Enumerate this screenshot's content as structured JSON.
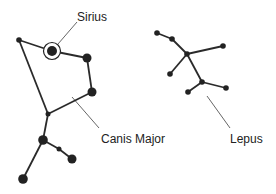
{
  "colors": {
    "background": "#ffffff",
    "star": "#222222",
    "edge": "#2a2a2a",
    "leader": "#555555",
    "text": "#222222"
  },
  "labels": {
    "sirius": {
      "text": "Sirius",
      "x": 77,
      "y": 10
    },
    "canis_major": {
      "text": "Canis Major",
      "x": 101,
      "y": 132
    },
    "lepus": {
      "text": "Lepus",
      "x": 230,
      "y": 132
    }
  },
  "constellations": [
    {
      "name": "Canis Major",
      "stars": [
        {
          "id": "cma1",
          "x": 19,
          "y": 40,
          "r": 2.8
        },
        {
          "id": "sirius",
          "x": 52,
          "y": 51,
          "r": 5,
          "ring": 8.5
        },
        {
          "id": "cma3",
          "x": 87,
          "y": 58,
          "r": 4.5
        },
        {
          "id": "cma4",
          "x": 92,
          "y": 92,
          "r": 4.5
        },
        {
          "id": "cma5",
          "x": 48,
          "y": 114,
          "r": 2.5
        },
        {
          "id": "cma6",
          "x": 43,
          "y": 140,
          "r": 4.8
        },
        {
          "id": "cma7",
          "x": 59,
          "y": 149,
          "r": 2.5
        },
        {
          "id": "cma8",
          "x": 72,
          "y": 159,
          "r": 4.5
        },
        {
          "id": "cma9",
          "x": 23,
          "y": 179,
          "r": 4.8
        }
      ],
      "edges": [
        [
          "cma1",
          "sirius"
        ],
        [
          "sirius",
          "cma3"
        ],
        [
          "cma3",
          "cma4"
        ],
        [
          "cma4",
          "cma5"
        ],
        [
          "cma1",
          "cma5"
        ],
        [
          "cma5",
          "cma6"
        ],
        [
          "cma6",
          "cma7"
        ],
        [
          "cma7",
          "cma8"
        ],
        [
          "cma6",
          "cma9"
        ]
      ]
    },
    {
      "name": "Lepus",
      "stars": [
        {
          "id": "lep1",
          "x": 157,
          "y": 33,
          "r": 2.8
        },
        {
          "id": "lep2",
          "x": 172,
          "y": 39,
          "r": 2.8
        },
        {
          "id": "lep3",
          "x": 187,
          "y": 54,
          "r": 2.8
        },
        {
          "id": "lep4",
          "x": 223,
          "y": 46,
          "r": 2.8
        },
        {
          "id": "lep5",
          "x": 170,
          "y": 74,
          "r": 2.8
        },
        {
          "id": "lep6",
          "x": 202,
          "y": 82,
          "r": 2.8
        },
        {
          "id": "lep7",
          "x": 188,
          "y": 92,
          "r": 2.8
        },
        {
          "id": "lep8",
          "x": 226,
          "y": 88,
          "r": 2.8
        }
      ],
      "edges": [
        [
          "lep1",
          "lep2"
        ],
        [
          "lep2",
          "lep3"
        ],
        [
          "lep3",
          "lep4"
        ],
        [
          "lep3",
          "lep5"
        ],
        [
          "lep3",
          "lep6"
        ],
        [
          "lep6",
          "lep7"
        ],
        [
          "lep6",
          "lep8"
        ]
      ]
    }
  ],
  "leaders": [
    {
      "name": "sirius-leader",
      "x1": 77,
      "y1": 22,
      "x2": 58,
      "y2": 44
    },
    {
      "name": "canis-major-leader",
      "x1": 72,
      "y1": 97,
      "x2": 99,
      "y2": 128
    },
    {
      "name": "lepus-leader",
      "x1": 207,
      "y1": 96,
      "x2": 230,
      "y2": 128
    }
  ]
}
